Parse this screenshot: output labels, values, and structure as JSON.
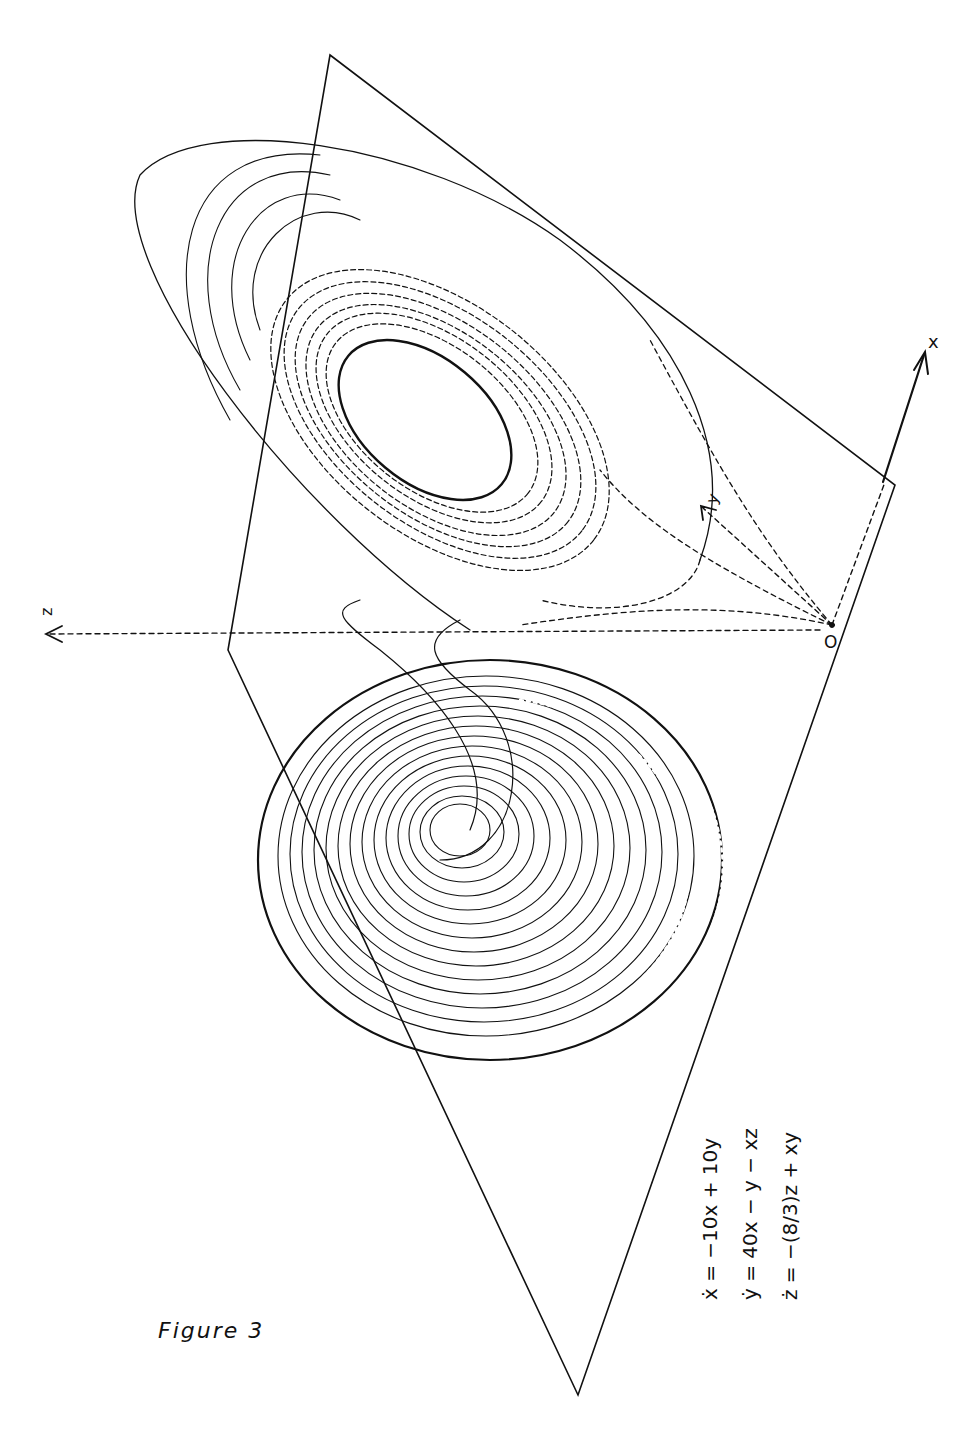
{
  "figure": {
    "caption": "Figure 3",
    "axes": {
      "x_label": "x",
      "y_label": "y",
      "z_label": "z",
      "origin_label": "O"
    },
    "equations": [
      {
        "lhs": "ẋ",
        "rhs": "= −10x + 10y"
      },
      {
        "lhs": "ẏ",
        "rhs": "= 40x − y − xz"
      },
      {
        "lhs": "ż",
        "rhs": "= −(8/3)z + xy"
      }
    ],
    "parameters": {
      "sigma": 10,
      "rho": 40,
      "beta": "8/3"
    },
    "line_color": "#111111",
    "background": "#ffffff"
  }
}
